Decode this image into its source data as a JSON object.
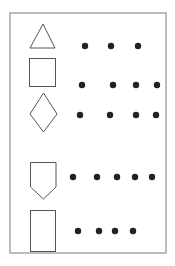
{
  "diagram": {
    "title": "",
    "border": {
      "x": 10,
      "y": 13,
      "width": 156,
      "height": 240,
      "color": "#7a7a7a"
    },
    "stroke_color": "#555555",
    "dot_color": "#222222",
    "rows": [
      {
        "shape": "triangle",
        "dot_count": 3,
        "dot_y": 46,
        "dot_x": [
          85,
          111,
          138
        ]
      },
      {
        "shape": "square",
        "dot_count": 4,
        "dot_y": 85,
        "dot_x": [
          82,
          113,
          136,
          157
        ]
      },
      {
        "shape": "diamond",
        "dot_count": 4,
        "dot_y": 115,
        "dot_x": [
          80,
          110,
          136,
          156
        ]
      },
      {
        "shape": "pentagon",
        "dot_count": 5,
        "dot_y": 177,
        "dot_x": [
          73,
          97,
          117,
          135,
          152
        ]
      },
      {
        "shape": "rectangle",
        "dot_count": 4,
        "dot_y": 231,
        "dot_x": [
          78,
          99,
          115,
          133
        ]
      }
    ]
  }
}
